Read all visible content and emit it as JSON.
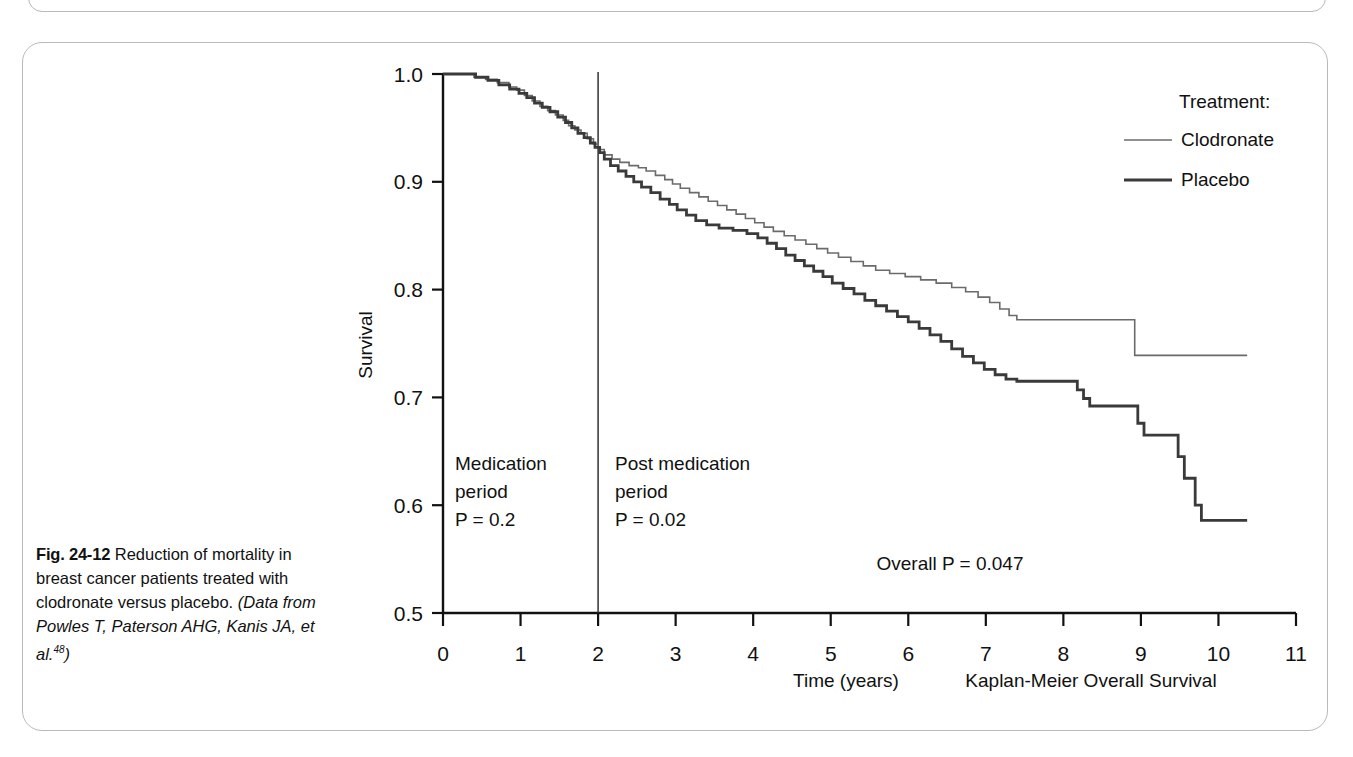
{
  "figure": {
    "caption_number": "Fig. 24-12",
    "caption_text": " Reduction of mortality in breast cancer patients treated with clodronate versus placebo. ",
    "caption_source": "(Data from Powles T, Paterson AHG, Kanis JA, et al.",
    "caption_source_ref": "48",
    "caption_source_end": ")"
  },
  "legend": {
    "title": "Treatment:",
    "items": [
      {
        "label": "Clodronate",
        "color": "#6b6b6b",
        "width": 1.6
      },
      {
        "label": "Placebo",
        "color": "#3a3a3a",
        "width": 2.8
      }
    ]
  },
  "annotations": {
    "medication_period": {
      "line1": "Medication",
      "line2": "period",
      "line3": "P = 0.2"
    },
    "post_medication_period": {
      "line1": "Post medication",
      "line2": "period",
      "line3": "P = 0.02"
    },
    "overall": "Overall P = 0.047",
    "subtitle": "Kaplan-Meier Overall Survival"
  },
  "chart_data": {
    "type": "line",
    "subtype": "kaplan-meier-step",
    "title": "",
    "subtitle": "Kaplan-Meier Overall Survival",
    "xlabel": "Time (years)",
    "ylabel": "Survival",
    "xlim": [
      0,
      11
    ],
    "ylim": [
      0.5,
      1.0
    ],
    "xticks": [
      0,
      1,
      2,
      3,
      4,
      5,
      6,
      7,
      8,
      9,
      10,
      11
    ],
    "yticks": [
      0.5,
      0.6,
      0.7,
      0.8,
      0.9,
      1.0
    ],
    "xtick_labels": [
      "0",
      "1",
      "2",
      "3",
      "4",
      "5",
      "6",
      "7",
      "8",
      "9",
      "10",
      "11"
    ],
    "ytick_labels": [
      "0.5",
      "0.6",
      "0.7",
      "0.8",
      "0.9",
      "1.0"
    ],
    "grid": false,
    "legend_position": "top-right",
    "vertical_reference_line": {
      "x": 2,
      "label": "end of medication period"
    },
    "series": [
      {
        "name": "Clodronate",
        "color": "#6b6b6b",
        "width": 1.6,
        "points": [
          [
            0.0,
            1.0
          ],
          [
            0.32,
            1.0
          ],
          [
            0.4,
            0.997
          ],
          [
            0.55,
            0.995
          ],
          [
            0.7,
            0.992
          ],
          [
            0.85,
            0.988
          ],
          [
            0.95,
            0.985
          ],
          [
            1.05,
            0.98
          ],
          [
            1.15,
            0.975
          ],
          [
            1.25,
            0.97
          ],
          [
            1.35,
            0.966
          ],
          [
            1.45,
            0.962
          ],
          [
            1.55,
            0.957
          ],
          [
            1.62,
            0.952
          ],
          [
            1.7,
            0.948
          ],
          [
            1.78,
            0.945
          ],
          [
            1.86,
            0.94
          ],
          [
            1.94,
            0.935
          ],
          [
            2.0,
            0.93
          ],
          [
            2.08,
            0.925
          ],
          [
            2.18,
            0.921
          ],
          [
            2.28,
            0.918
          ],
          [
            2.4,
            0.915
          ],
          [
            2.52,
            0.913
          ],
          [
            2.62,
            0.91
          ],
          [
            2.74,
            0.906
          ],
          [
            2.86,
            0.902
          ],
          [
            2.96,
            0.898
          ],
          [
            3.06,
            0.894
          ],
          [
            3.18,
            0.89
          ],
          [
            3.3,
            0.886
          ],
          [
            3.42,
            0.882
          ],
          [
            3.54,
            0.878
          ],
          [
            3.66,
            0.874
          ],
          [
            3.78,
            0.87
          ],
          [
            3.9,
            0.866
          ],
          [
            4.02,
            0.862
          ],
          [
            4.14,
            0.858
          ],
          [
            4.26,
            0.854
          ],
          [
            4.4,
            0.85
          ],
          [
            4.54,
            0.846
          ],
          [
            4.68,
            0.842
          ],
          [
            4.82,
            0.838
          ],
          [
            4.96,
            0.834
          ],
          [
            5.1,
            0.83
          ],
          [
            5.26,
            0.826
          ],
          [
            5.42,
            0.822
          ],
          [
            5.58,
            0.818
          ],
          [
            5.76,
            0.815
          ],
          [
            5.96,
            0.812
          ],
          [
            6.16,
            0.809
          ],
          [
            6.36,
            0.806
          ],
          [
            6.56,
            0.802
          ],
          [
            6.74,
            0.798
          ],
          [
            6.9,
            0.793
          ],
          [
            7.05,
            0.788
          ],
          [
            7.18,
            0.782
          ],
          [
            7.3,
            0.776
          ],
          [
            7.4,
            0.772
          ],
          [
            8.87,
            0.772
          ],
          [
            8.92,
            0.739
          ],
          [
            10.37,
            0.739
          ]
        ]
      },
      {
        "name": "Placebo",
        "color": "#3a3a3a",
        "width": 2.8,
        "points": [
          [
            0.0,
            1.0
          ],
          [
            0.3,
            1.0
          ],
          [
            0.42,
            0.997
          ],
          [
            0.58,
            0.994
          ],
          [
            0.72,
            0.99
          ],
          [
            0.86,
            0.986
          ],
          [
            0.98,
            0.982
          ],
          [
            1.08,
            0.978
          ],
          [
            1.18,
            0.973
          ],
          [
            1.28,
            0.969
          ],
          [
            1.38,
            0.965
          ],
          [
            1.48,
            0.96
          ],
          [
            1.58,
            0.955
          ],
          [
            1.66,
            0.95
          ],
          [
            1.74,
            0.945
          ],
          [
            1.82,
            0.941
          ],
          [
            1.9,
            0.936
          ],
          [
            1.96,
            0.932
          ],
          [
            2.02,
            0.927
          ],
          [
            2.08,
            0.921
          ],
          [
            2.16,
            0.915
          ],
          [
            2.26,
            0.91
          ],
          [
            2.36,
            0.905
          ],
          [
            2.46,
            0.9
          ],
          [
            2.56,
            0.895
          ],
          [
            2.68,
            0.89
          ],
          [
            2.8,
            0.884
          ],
          [
            2.92,
            0.879
          ],
          [
            3.02,
            0.874
          ],
          [
            3.14,
            0.869
          ],
          [
            3.26,
            0.864
          ],
          [
            3.4,
            0.86
          ],
          [
            3.56,
            0.857
          ],
          [
            3.74,
            0.855
          ],
          [
            3.92,
            0.852
          ],
          [
            4.06,
            0.848
          ],
          [
            4.18,
            0.843
          ],
          [
            4.3,
            0.838
          ],
          [
            4.42,
            0.832
          ],
          [
            4.54,
            0.827
          ],
          [
            4.66,
            0.822
          ],
          [
            4.78,
            0.817
          ],
          [
            4.9,
            0.812
          ],
          [
            5.02,
            0.806
          ],
          [
            5.16,
            0.801
          ],
          [
            5.3,
            0.796
          ],
          [
            5.44,
            0.79
          ],
          [
            5.58,
            0.785
          ],
          [
            5.72,
            0.78
          ],
          [
            5.86,
            0.775
          ],
          [
            6.0,
            0.77
          ],
          [
            6.14,
            0.764
          ],
          [
            6.28,
            0.758
          ],
          [
            6.42,
            0.752
          ],
          [
            6.56,
            0.745
          ],
          [
            6.7,
            0.738
          ],
          [
            6.84,
            0.732
          ],
          [
            6.98,
            0.726
          ],
          [
            7.12,
            0.721
          ],
          [
            7.26,
            0.717
          ],
          [
            7.4,
            0.715
          ],
          [
            8.1,
            0.715
          ],
          [
            8.18,
            0.707
          ],
          [
            8.26,
            0.699
          ],
          [
            8.34,
            0.692
          ],
          [
            8.88,
            0.692
          ],
          [
            8.96,
            0.676
          ],
          [
            9.04,
            0.665
          ],
          [
            9.4,
            0.665
          ],
          [
            9.48,
            0.645
          ],
          [
            9.56,
            0.625
          ],
          [
            9.7,
            0.6
          ],
          [
            9.78,
            0.586
          ],
          [
            10.37,
            0.586
          ]
        ]
      }
    ]
  }
}
